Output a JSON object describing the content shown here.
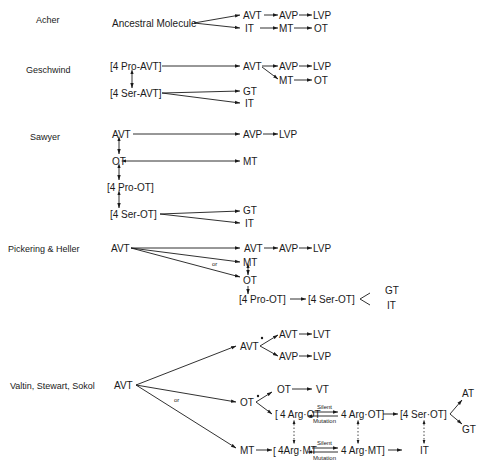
{
  "models": [
    {
      "author": "Acher",
      "nodes": {
        "root": "Ancestral Molecule",
        "a1": "AVT",
        "a2": "AVP",
        "a3": "LVP",
        "b1": "IT",
        "b2": "MT",
        "b3": "OT"
      }
    },
    {
      "author": "Geschwind",
      "nodes": {
        "p1": "[4 Pro-AVT]",
        "p2": "[4 Ser-AVT]",
        "a1": "AVT",
        "a2": "AVP",
        "a3": "LVP",
        "m1": "MT",
        "m2": "OT",
        "g": "GT",
        "i": "IT"
      }
    },
    {
      "author": "Sawyer",
      "nodes": {
        "avt": "AVT",
        "ot": "OT",
        "pro": "[4 Pro-OT]",
        "ser": "[4 Ser-OT]",
        "avp": "AVP",
        "lvp": "LVP",
        "mt": "MT",
        "gt": "GT",
        "it": "IT"
      }
    },
    {
      "author": "Pickering & Heller",
      "nodes": {
        "avt": "AVT",
        "avt2": "AVT",
        "avp": "AVP",
        "lvp": "LVP",
        "mt": "MT",
        "ot": "OT",
        "pro": "[4 Pro-OT]",
        "ser": "[4 Ser-OT]",
        "gt": "GT",
        "it": "IT",
        "or": "or"
      }
    },
    {
      "author": "Valtin, Stewart, Sokol",
      "nodes": {
        "avt": "AVT",
        "avt2": "AVT",
        "avt3": "AVT",
        "lvt": "LVT",
        "avp": "AVP",
        "lvp": "LVP",
        "ot": "OT",
        "ot2": "OT",
        "vt": "VT",
        "argot1": "4 Arg·OT",
        "argot2": "4 Arg·OT]",
        "serot": "[4 Ser·OT]",
        "at": "AT",
        "gt": "GT",
        "mt": "MT",
        "argmt1": "4Arg·MT",
        "argmt2": "4 Arg·MT]",
        "it": "IT",
        "silent": "Silent",
        "mutation": "Mutation",
        "or": "or"
      }
    }
  ]
}
